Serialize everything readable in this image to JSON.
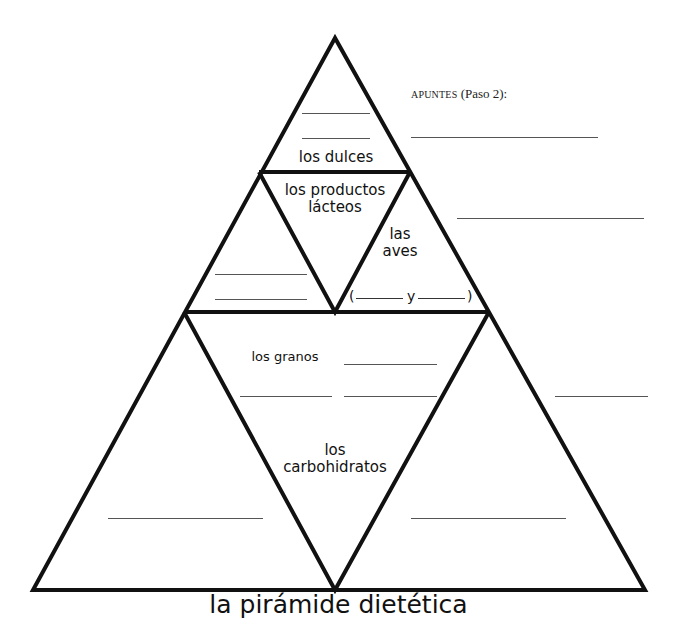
{
  "diagram": {
    "title": "la pirámide dietética",
    "notes": {
      "label_caps": "APUNTES",
      "label_rest": " (Paso 2):"
    },
    "sections": {
      "top": "los dulces",
      "dairy_line1": "los productos",
      "dairy_line2": "lácteos",
      "poultry_line1": "las",
      "poultry_line2": "aves",
      "poultry_blank_open": "(",
      "poultry_blank_y": "y",
      "poultry_blank_close": ")",
      "grains": "los granos",
      "carbs_line1": "los",
      "carbs_line2": "carbohidratos"
    },
    "colors": {
      "line": "#111111",
      "blank_line": "#555555",
      "background": "#ffffff"
    }
  }
}
